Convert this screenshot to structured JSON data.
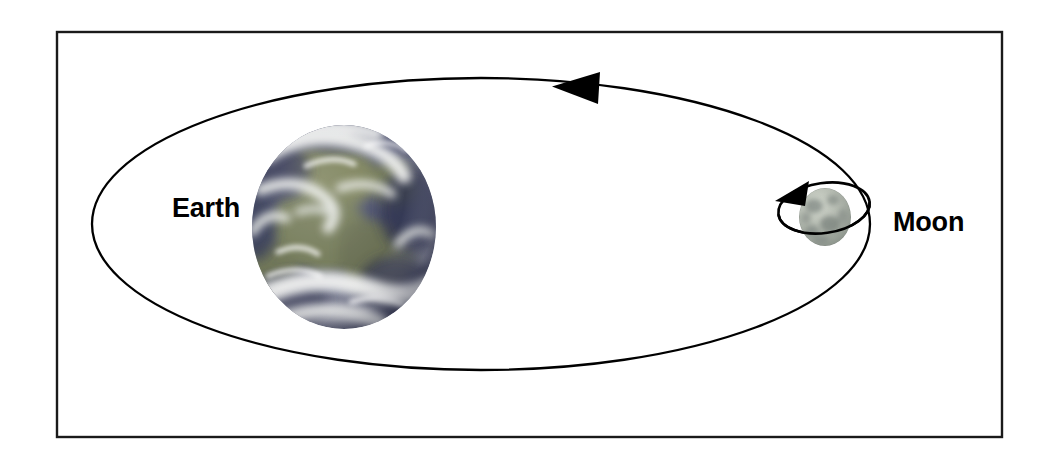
{
  "diagram": {
    "background_color": "#ffffff",
    "frame": {
      "name": "outer-frame",
      "stroke_color": "#1a1a1a",
      "stroke_width": 2.4,
      "x": 57,
      "y": 32,
      "width": 945,
      "height": 405
    },
    "bodies": [
      {
        "id": "earth",
        "label": "Earth",
        "label_x": 172,
        "label_y": 217,
        "cx": 344,
        "cy": 227,
        "rx": 92,
        "ry": 102,
        "ocean_color": "#3c3f5e",
        "land_color": "#7e8458",
        "cloud_color": "#f3f4f2",
        "shadow_color": "#262a42"
      },
      {
        "id": "moon",
        "label": "Moon",
        "label_x": 893,
        "label_y": 231,
        "cx": 825,
        "cy": 217,
        "rx": 26,
        "ry": 29,
        "surface_color": "#aab0a8",
        "maria_color": "#7c8480",
        "highlight_color": "#c9cfc6"
      }
    ],
    "orbits": [
      {
        "id": "moon-around-earth",
        "name": "lunar-orbit-path",
        "cx": 481,
        "cy": 224,
        "rx": 389,
        "ry": 146,
        "stroke_color": "#000000",
        "stroke_width": 2.3,
        "direction": "counterclockwise",
        "arrow_x": 578,
        "arrow_y": 88
      },
      {
        "id": "moon-rotation",
        "name": "moon-spin-path",
        "cx": 824,
        "cy": 208,
        "rx": 46,
        "ry": 25,
        "rotation_deg": -8,
        "stroke_color": "#000000",
        "stroke_width": 2.6,
        "direction": "counterclockwise",
        "arrow_x": 787,
        "arrow_y": 193
      }
    ]
  }
}
